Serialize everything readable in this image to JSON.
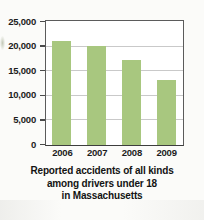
{
  "chart_data": {
    "type": "bar",
    "title": "",
    "caption_lines": [
      "Reported accidents of all kinds",
      "among drivers under 18",
      "in Massachusetts"
    ],
    "categories": [
      "2006",
      "2007",
      "2008",
      "2009"
    ],
    "values": [
      21200,
      20100,
      17200,
      13300
    ],
    "series": [
      {
        "name": "Reported accidents",
        "values": [
          21200,
          20100,
          17200,
          13300
        ]
      }
    ],
    "xlabel": "",
    "ylabel": "",
    "ylim": [
      0,
      25000
    ],
    "ytick_values": [
      25000,
      20000,
      15000,
      10000,
      5000,
      0
    ],
    "ytick_labels": [
      "25,000",
      "20,000",
      "15,000",
      "10,000",
      "5,000",
      "0"
    ],
    "grid": true,
    "grid_axis": "y",
    "legend": false,
    "legend_position": "none",
    "bar_color": "#a8c77f",
    "plot_background": "#ffffff",
    "figure_background": "#fbfbf9",
    "axis_color": "#4a4a4a",
    "gridline_color": "#c9c9c9",
    "text_color": "#1c1c1c"
  }
}
